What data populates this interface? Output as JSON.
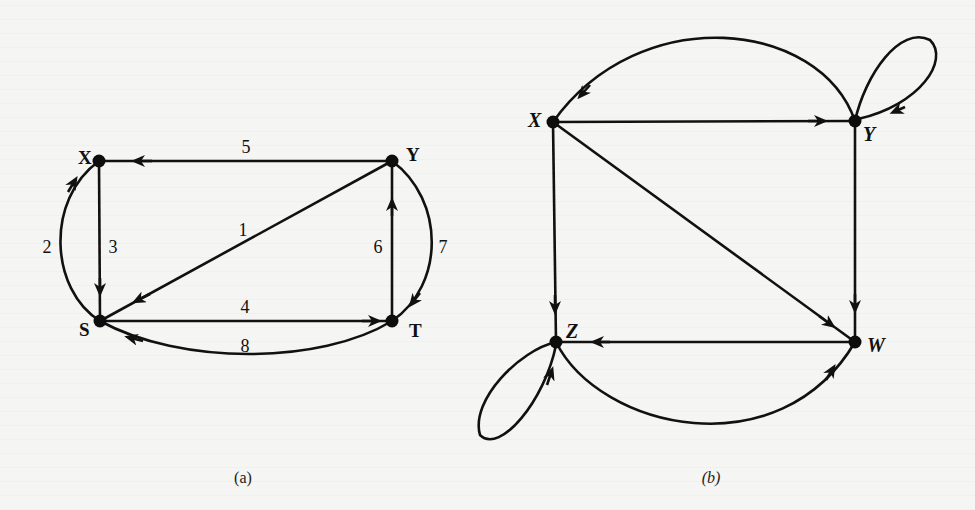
{
  "figure": {
    "graph_a": {
      "caption": "(a)",
      "nodes": [
        {
          "id": "X",
          "label": "X"
        },
        {
          "id": "Y",
          "label": "Y"
        },
        {
          "id": "S",
          "label": "S"
        },
        {
          "id": "T",
          "label": "T"
        }
      ],
      "edges": [
        {
          "from": "Y",
          "to": "S",
          "weight": "1"
        },
        {
          "from": "S",
          "to": "X",
          "weight": "2"
        },
        {
          "from": "X",
          "to": "S",
          "weight": "3"
        },
        {
          "from": "S",
          "to": "T",
          "weight": "4"
        },
        {
          "from": "Y",
          "to": "X",
          "weight": "5"
        },
        {
          "from": "T",
          "to": "Y",
          "weight": "6"
        },
        {
          "from": "Y",
          "to": "T",
          "weight": "7"
        },
        {
          "from": "T",
          "to": "S",
          "weight": "8"
        }
      ]
    },
    "graph_b": {
      "caption": "(b)",
      "nodes": [
        {
          "id": "X",
          "label": "X"
        },
        {
          "id": "Y",
          "label": "Y"
        },
        {
          "id": "Z",
          "label": "Z"
        },
        {
          "id": "W",
          "label": "W"
        }
      ],
      "edges": [
        {
          "from": "X",
          "to": "Y"
        },
        {
          "from": "Y",
          "to": "X"
        },
        {
          "from": "Y",
          "to": "Y",
          "type": "self-loop"
        },
        {
          "from": "X",
          "to": "Z"
        },
        {
          "from": "X",
          "to": "W"
        },
        {
          "from": "Y",
          "to": "W"
        },
        {
          "from": "W",
          "to": "Z"
        },
        {
          "from": "Z",
          "to": "W"
        },
        {
          "from": "Z",
          "to": "Z",
          "type": "self-loop"
        }
      ]
    }
  }
}
